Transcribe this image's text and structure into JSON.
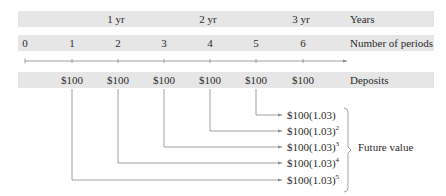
{
  "years_row": {
    "label": "Years",
    "ticks": [
      {
        "text": "1 yr",
        "x": 116
      },
      {
        "text": "2 yr",
        "x": 208
      },
      {
        "text": "3 yr",
        "x": 301
      }
    ]
  },
  "periods_row": {
    "label": "Number of periods",
    "ticks": [
      {
        "text": "0",
        "x": 25
      },
      {
        "text": "1",
        "x": 72
      },
      {
        "text": "2",
        "x": 118
      },
      {
        "text": "3",
        "x": 164
      },
      {
        "text": "4",
        "x": 210
      },
      {
        "text": "5",
        "x": 256
      },
      {
        "text": "6",
        "x": 303
      }
    ]
  },
  "deposits_row": {
    "label": "Deposits",
    "amounts": [
      "$100",
      "$100",
      "$100",
      "$100",
      "$100",
      "$100"
    ]
  },
  "future_values": {
    "label": "Future value",
    "base": "$100(1.03)",
    "items": [
      {
        "text": "$100(1.03)",
        "exp": ""
      },
      {
        "text": "$100(1.03)",
        "exp": "2"
      },
      {
        "text": "$100(1.03)",
        "exp": "3"
      },
      {
        "text": "$100(1.03)",
        "exp": "4"
      },
      {
        "text": "$100(1.03)",
        "exp": "5"
      }
    ]
  },
  "colors": {
    "band": "#e6e6e6",
    "line": "#8a8a8a",
    "text": "#2a2a2a"
  }
}
